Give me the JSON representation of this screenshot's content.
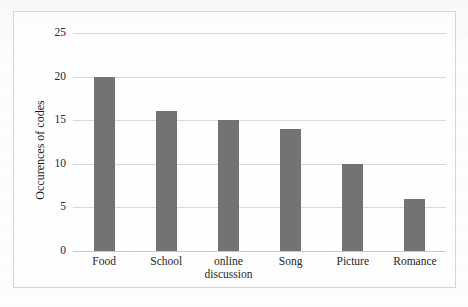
{
  "chart_data": {
    "type": "bar",
    "title": "",
    "xlabel": "",
    "ylabel": "Occurences of codes",
    "categories": [
      "Food",
      "School",
      "online discussion",
      "Song",
      "Picture",
      "Romance"
    ],
    "category_lines": [
      [
        "Food"
      ],
      [
        "School"
      ],
      [
        "online",
        "discussion"
      ],
      [
        "Song"
      ],
      [
        "Picture"
      ],
      [
        "Romance"
      ]
    ],
    "values": [
      20,
      16,
      15,
      14,
      10,
      6
    ],
    "ylim": [
      0,
      25
    ],
    "ytick_values": [
      0,
      5,
      10,
      15,
      20,
      25
    ],
    "ytick_labels": [
      "0",
      "5",
      "10",
      "15",
      "20",
      "25"
    ],
    "grid": true,
    "legend": false,
    "bar_color": "#737373",
    "gridline_color": "#d9d9d9",
    "border_color": "#d6d6d6"
  }
}
